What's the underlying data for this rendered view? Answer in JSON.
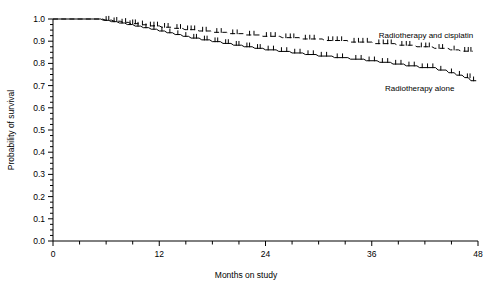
{
  "chart_data": {
    "type": "line",
    "subtype": "kaplan-meier-survival",
    "title": "",
    "xlabel": "Months on study",
    "ylabel": "Probability of survival",
    "xlim": [
      0,
      48
    ],
    "ylim": [
      0.0,
      1.0
    ],
    "grid": false,
    "legend_position": "inline-right",
    "x_major_ticks": [
      0,
      12,
      24,
      36,
      48
    ],
    "x_major_tick_labels": [
      "0",
      "12",
      "24",
      "36",
      "48"
    ],
    "x_minor_tick_interval": 3,
    "y_major_ticks": [
      0.0,
      0.1,
      0.2,
      0.3,
      0.4,
      0.5,
      0.6,
      0.7,
      0.8,
      0.9,
      1.0
    ],
    "y_major_tick_labels": [
      "0.0",
      "0.1",
      "0.2",
      "0.3",
      "0.4",
      "0.5",
      "0.6",
      "0.7",
      "0.8",
      "0.9",
      "1.0"
    ],
    "y_minor_tick_interval": 0.025,
    "series": [
      {
        "name": "Radiotherapy and cisplatin",
        "label": "Radiotherapy and cisplatin",
        "style": "dashed",
        "color": "#000000",
        "label_x": 36.8,
        "label_y": 0.915,
        "final_value": 0.855,
        "points": [
          [
            0.0,
            1.0
          ],
          [
            5.6,
            1.0
          ],
          [
            5.9,
            0.995
          ],
          [
            6.6,
            0.995
          ],
          [
            6.9,
            0.99
          ],
          [
            7.6,
            0.99
          ],
          [
            7.9,
            0.985
          ],
          [
            8.5,
            0.985
          ],
          [
            8.8,
            0.979
          ],
          [
            9.6,
            0.979
          ],
          [
            9.9,
            0.974
          ],
          [
            10.6,
            0.974
          ],
          [
            10.9,
            0.969
          ],
          [
            12.0,
            0.969
          ],
          [
            12.3,
            0.963
          ],
          [
            13.4,
            0.963
          ],
          [
            13.7,
            0.958
          ],
          [
            14.6,
            0.958
          ],
          [
            14.9,
            0.952
          ],
          [
            16.2,
            0.952
          ],
          [
            16.5,
            0.946
          ],
          [
            17.8,
            0.946
          ],
          [
            18.1,
            0.94
          ],
          [
            19.6,
            0.94
          ],
          [
            19.9,
            0.934
          ],
          [
            21.5,
            0.934
          ],
          [
            21.8,
            0.928
          ],
          [
            23.4,
            0.928
          ],
          [
            23.7,
            0.922
          ],
          [
            25.6,
            0.922
          ],
          [
            25.9,
            0.916
          ],
          [
            27.8,
            0.916
          ],
          [
            28.1,
            0.91
          ],
          [
            30.4,
            0.91
          ],
          [
            30.7,
            0.903
          ],
          [
            33.2,
            0.903
          ],
          [
            33.5,
            0.896
          ],
          [
            36.0,
            0.896
          ],
          [
            36.3,
            0.889
          ],
          [
            38.6,
            0.889
          ],
          [
            38.9,
            0.882
          ],
          [
            40.8,
            0.882
          ],
          [
            41.1,
            0.875
          ],
          [
            42.8,
            0.875
          ],
          [
            43.1,
            0.868
          ],
          [
            44.6,
            0.868
          ],
          [
            44.9,
            0.861
          ],
          [
            45.8,
            0.861
          ],
          [
            46.1,
            0.855
          ],
          [
            47.4,
            0.855
          ]
        ],
        "censor_marks": [
          6.3,
          7.2,
          8.2,
          9.0,
          9.3,
          10.1,
          11.0,
          11.4,
          11.8,
          12.6,
          13.0,
          14.0,
          14.4,
          15.2,
          15.6,
          16.0,
          16.9,
          17.3,
          18.5,
          19.0,
          20.3,
          20.8,
          22.2,
          22.7,
          24.1,
          24.6,
          25.1,
          26.3,
          26.8,
          27.2,
          28.5,
          29.0,
          29.5,
          31.1,
          31.6,
          32.1,
          32.6,
          34.0,
          34.5,
          35.0,
          35.5,
          36.8,
          37.3,
          37.8,
          38.2,
          39.4,
          39.9,
          40.3,
          41.6,
          42.1,
          42.5,
          43.6,
          44.0,
          45.3,
          46.5,
          46.9,
          47.2
        ]
      },
      {
        "name": "Radiotherapy alone",
        "label": "Radiotherapy alone",
        "style": "solid",
        "color": "#000000",
        "label_x": 37.5,
        "label_y": 0.675,
        "final_value": 0.722,
        "points": [
          [
            0.0,
            1.0
          ],
          [
            5.4,
            1.0
          ],
          [
            5.7,
            0.994
          ],
          [
            6.3,
            0.994
          ],
          [
            6.6,
            0.988
          ],
          [
            7.2,
            0.988
          ],
          [
            7.5,
            0.982
          ],
          [
            8.1,
            0.982
          ],
          [
            8.4,
            0.975
          ],
          [
            9.0,
            0.975
          ],
          [
            9.3,
            0.968
          ],
          [
            9.9,
            0.968
          ],
          [
            10.2,
            0.961
          ],
          [
            10.8,
            0.961
          ],
          [
            11.1,
            0.954
          ],
          [
            11.7,
            0.954
          ],
          [
            12.0,
            0.946
          ],
          [
            12.6,
            0.946
          ],
          [
            12.9,
            0.938
          ],
          [
            13.5,
            0.938
          ],
          [
            13.8,
            0.93
          ],
          [
            14.4,
            0.93
          ],
          [
            14.7,
            0.922
          ],
          [
            15.3,
            0.922
          ],
          [
            15.6,
            0.914
          ],
          [
            16.5,
            0.914
          ],
          [
            16.8,
            0.906
          ],
          [
            17.7,
            0.906
          ],
          [
            18.0,
            0.898
          ],
          [
            18.9,
            0.898
          ],
          [
            19.2,
            0.89
          ],
          [
            20.1,
            0.89
          ],
          [
            20.4,
            0.882
          ],
          [
            21.3,
            0.882
          ],
          [
            21.6,
            0.875
          ],
          [
            22.5,
            0.875
          ],
          [
            22.8,
            0.868
          ],
          [
            23.7,
            0.868
          ],
          [
            24.0,
            0.861
          ],
          [
            25.2,
            0.861
          ],
          [
            25.5,
            0.854
          ],
          [
            26.7,
            0.854
          ],
          [
            27.0,
            0.847
          ],
          [
            28.2,
            0.847
          ],
          [
            28.5,
            0.84
          ],
          [
            29.7,
            0.84
          ],
          [
            30.0,
            0.833
          ],
          [
            31.5,
            0.833
          ],
          [
            31.8,
            0.826
          ],
          [
            33.3,
            0.826
          ],
          [
            33.6,
            0.819
          ],
          [
            35.1,
            0.819
          ],
          [
            35.4,
            0.812
          ],
          [
            36.6,
            0.812
          ],
          [
            36.9,
            0.805
          ],
          [
            38.1,
            0.805
          ],
          [
            38.4,
            0.797
          ],
          [
            39.6,
            0.797
          ],
          [
            39.9,
            0.789
          ],
          [
            41.1,
            0.789
          ],
          [
            41.4,
            0.781
          ],
          [
            43.2,
            0.781
          ],
          [
            43.5,
            0.77
          ],
          [
            44.4,
            0.77
          ],
          [
            44.7,
            0.758
          ],
          [
            45.3,
            0.758
          ],
          [
            45.6,
            0.747
          ],
          [
            46.2,
            0.747
          ],
          [
            46.5,
            0.736
          ],
          [
            46.9,
            0.736
          ],
          [
            47.2,
            0.722
          ],
          [
            47.8,
            0.722
          ]
        ],
        "censor_marks": [
          6.0,
          6.9,
          7.8,
          8.7,
          9.6,
          10.5,
          11.4,
          12.3,
          13.2,
          14.1,
          15.0,
          15.9,
          16.2,
          17.1,
          17.4,
          18.3,
          18.6,
          19.5,
          19.8,
          20.7,
          21.0,
          21.9,
          22.2,
          23.1,
          23.4,
          24.3,
          24.9,
          25.8,
          26.4,
          27.3,
          27.9,
          28.8,
          29.4,
          30.3,
          30.9,
          32.1,
          32.7,
          34.2,
          34.8,
          35.7,
          36.3,
          37.2,
          37.8,
          38.7,
          39.3,
          40.2,
          40.8,
          41.7,
          42.3,
          42.9,
          43.8,
          45.0,
          45.9,
          46.8,
          47.1,
          47.5
        ]
      }
    ]
  },
  "figure": {
    "background": "#ffffff",
    "axis_color": "#000000",
    "line_color": "#000000"
  }
}
